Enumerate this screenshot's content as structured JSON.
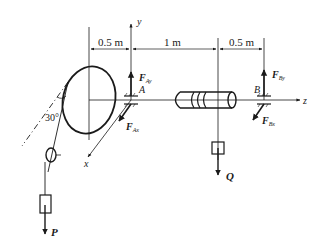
{
  "figure": {
    "dimensions": [
      {
        "id": "d1",
        "label": "0.5 m"
      },
      {
        "id": "d2",
        "label": "1 m"
      },
      {
        "id": "d3",
        "label": "0.5 m"
      }
    ],
    "axes": {
      "x": "x",
      "y": "y",
      "z": "z"
    },
    "supports": {
      "A": "A",
      "B": "B"
    },
    "forces": {
      "FAy": {
        "main": "F",
        "sub": "Ay"
      },
      "FAx": {
        "main": "F",
        "sub": "Ax"
      },
      "FBy": {
        "main": "F",
        "sub": "By"
      },
      "FBx": {
        "main": "F",
        "sub": "Bx"
      }
    },
    "loads": {
      "P": "P",
      "Q": "Q"
    },
    "angle": "30°",
    "colors": {
      "stroke": "#1a1a1a",
      "background": "#ffffff"
    }
  }
}
